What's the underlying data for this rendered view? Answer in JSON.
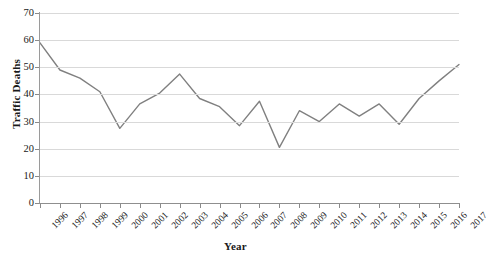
{
  "chart_data": {
    "type": "line",
    "title": "",
    "xlabel": "Year",
    "ylabel": "Traffic Deaths",
    "x": [
      1996,
      1997,
      1998,
      1999,
      2000,
      2001,
      2002,
      2003,
      2004,
      2005,
      2006,
      2007,
      2008,
      2009,
      2010,
      2011,
      2012,
      2013,
      2014,
      2015,
      2016,
      2017
    ],
    "categories": [
      "1996",
      "1997",
      "1998",
      "1999",
      "2000",
      "2001",
      "2002",
      "2003",
      "2004",
      "2005",
      "2006",
      "2007",
      "2008",
      "2009",
      "2010",
      "2011",
      "2012",
      "2013",
      "2014",
      "2015",
      "2016",
      "2017"
    ],
    "values": [
      59,
      49,
      46,
      41,
      27.5,
      36.5,
      40.5,
      47.5,
      38.5,
      35.5,
      28.5,
      37.5,
      20.5,
      34,
      30,
      36.5,
      32,
      36.5,
      29,
      38.5,
      45,
      51
    ],
    "series": [
      {
        "name": "Traffic Deaths",
        "values": [
          59,
          49,
          46,
          41,
          27.5,
          36.5,
          40.5,
          47.5,
          38.5,
          35.5,
          28.5,
          37.5,
          20.5,
          34,
          30,
          36.5,
          32,
          36.5,
          29,
          38.5,
          45,
          51
        ]
      }
    ],
    "yticks": [
      0,
      10,
      20,
      30,
      40,
      50,
      60,
      70
    ],
    "ytick_labels": [
      "0",
      "10",
      "20",
      "30",
      "40",
      "50",
      "60",
      "70"
    ],
    "ylim": [
      0,
      70
    ],
    "xlim": [
      1996,
      2017
    ],
    "grid": "horizontal",
    "legend": "none",
    "line_color": "#808080",
    "grid_color": "#d9d9d9",
    "axis_color": "#8f8f8f",
    "background": "#ffffff"
  }
}
